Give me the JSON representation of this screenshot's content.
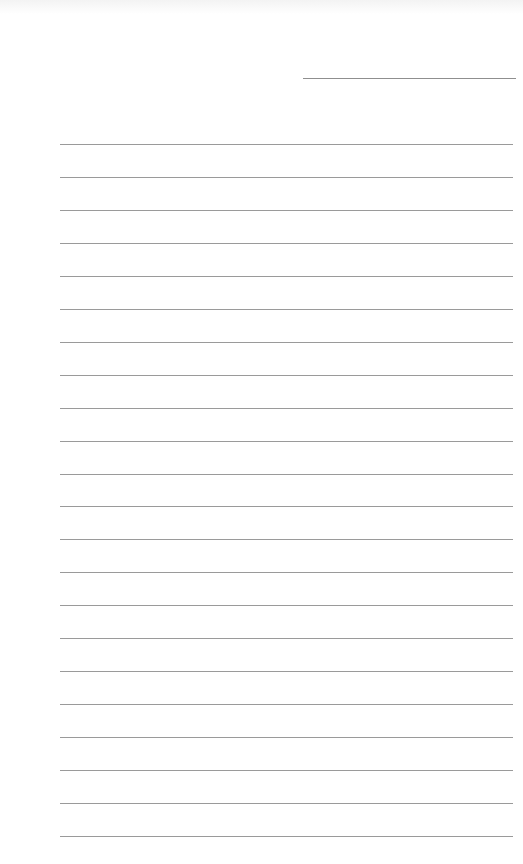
{
  "page": {
    "type": "lined-paper",
    "background": "#ffffff",
    "line_color": "#9a9a9a",
    "header_line": {
      "x": 303,
      "y": 78,
      "width": 213
    },
    "ruled_lines": {
      "count": 22,
      "start_y": 144,
      "spacing": 32.95,
      "x": 60,
      "width": 453
    }
  }
}
